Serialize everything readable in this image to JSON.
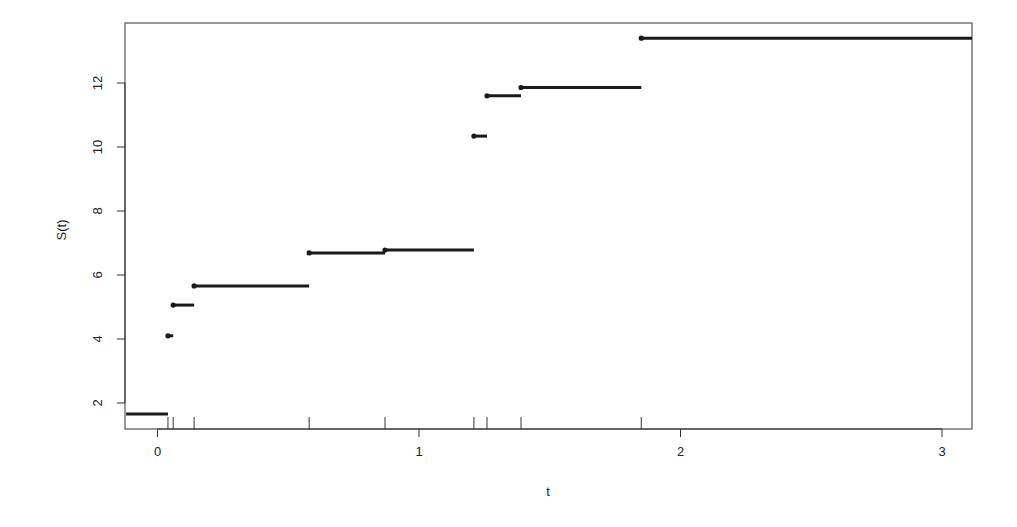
{
  "chart_data": {
    "type": "line",
    "subtype": "step-function",
    "title": "",
    "xlabel": "t",
    "ylabel": "S(t)",
    "xlim": [
      -0.12,
      3.12
    ],
    "ylim": [
      1.2,
      13.9
    ],
    "x_ticks": [
      0,
      1,
      2,
      3
    ],
    "x_tick_labels": [
      "0",
      "1",
      "2",
      "3"
    ],
    "y_ticks": [
      2,
      4,
      6,
      8,
      10,
      12
    ],
    "y_tick_labels": [
      "2",
      "4",
      "6",
      "8",
      "10",
      "12"
    ],
    "grid": false,
    "legend": null,
    "segments": [
      {
        "x_start": -0.12,
        "x_end": 0.04,
        "y": 1.66,
        "left_dot": false
      },
      {
        "x_start": 0.04,
        "x_end": 0.06,
        "y": 4.1,
        "left_dot": true
      },
      {
        "x_start": 0.06,
        "x_end": 0.14,
        "y": 5.06,
        "left_dot": true
      },
      {
        "x_start": 0.14,
        "x_end": 0.58,
        "y": 5.66,
        "left_dot": true
      },
      {
        "x_start": 0.58,
        "x_end": 0.87,
        "y": 6.69,
        "left_dot": true
      },
      {
        "x_start": 0.87,
        "x_end": 1.21,
        "y": 6.78,
        "left_dot": true
      },
      {
        "x_start": 1.21,
        "x_end": 1.26,
        "y": 10.34,
        "left_dot": true
      },
      {
        "x_start": 1.26,
        "x_end": 1.39,
        "y": 11.6,
        "left_dot": true
      },
      {
        "x_start": 1.39,
        "x_end": 1.85,
        "y": 11.86,
        "left_dot": true
      },
      {
        "x_start": 1.85,
        "x_end": 3.12,
        "y": 13.4,
        "left_dot": true
      }
    ],
    "rug_ticks": [
      0.04,
      0.06,
      0.14,
      0.58,
      0.87,
      1.21,
      1.26,
      1.39,
      1.85
    ]
  },
  "colors": {
    "line": "#1a1a1a",
    "axis": "#333333",
    "background": "#ffffff"
  }
}
